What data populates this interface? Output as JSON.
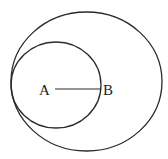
{
  "diagram": {
    "type": "geometry",
    "stroke_color": "#2a2a2a",
    "background": "#ffffff",
    "points": {
      "A": {
        "label": "A"
      },
      "B": {
        "label": "B"
      }
    },
    "segments": [
      {
        "from": "A",
        "to": "B"
      }
    ],
    "circles": [
      {
        "name": "large-circle",
        "note": "outer circle"
      },
      {
        "name": "small-circle",
        "note": "centered at A, passes through B"
      }
    ]
  }
}
